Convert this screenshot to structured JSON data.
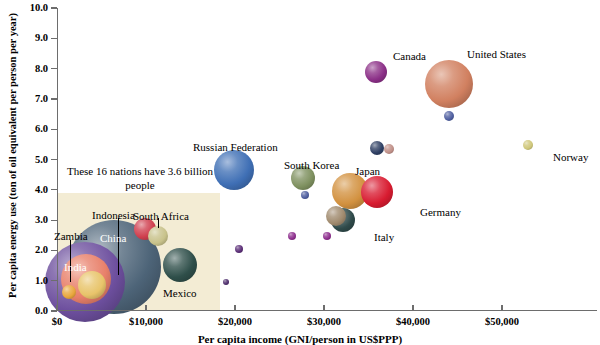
{
  "chart_data": {
    "type": "scatter",
    "title": "",
    "xlabel": "Per capita income (GNI/person in US$PPP)",
    "ylabel": "Per capita energy use (ton of oil equivalent per person per year)",
    "xlim": [
      0,
      55000
    ],
    "ylim": [
      0,
      10
    ],
    "grid": false,
    "legend": null,
    "bubble_meaning": "bubble area proportional to population",
    "annotation": "These 16 nations have 3.6 billion people",
    "xticks": [
      "$0",
      "$10,000",
      "$20,000",
      "$30,000",
      "$40,000",
      "$50,000"
    ],
    "xtick_values": [
      0,
      10000,
      20000,
      30000,
      40000,
      50000
    ],
    "yticks": [
      "0.0",
      "1.0",
      "2.0",
      "3.0",
      "4.0",
      "5.0",
      "6.0",
      "7.0",
      "8.0",
      "9.0",
      "10.0"
    ],
    "ytick_values": [
      0,
      1,
      2,
      3,
      4,
      5,
      6,
      7,
      8,
      9,
      10
    ],
    "points": [
      {
        "name": "Zambia",
        "x": 1300,
        "y": 0.62,
        "r": 7,
        "color": "#e8a63c",
        "label": "Zambia",
        "label_x": 54,
        "label_y": 231,
        "label_light": false,
        "leader": {
          "x": 70,
          "y": 240,
          "h": 42
        }
      },
      {
        "name": "India",
        "x": 3300,
        "y": 1.05,
        "r": 25,
        "color": "#e8806a",
        "label": "India",
        "label_x": 64,
        "label_y": 262,
        "label_light": true,
        "leader": null
      },
      {
        "name": "India-outer",
        "x": 3100,
        "y": 0.95,
        "r": 40,
        "color": "#6d4f9e",
        "label": "",
        "label_x": 0,
        "label_y": 0,
        "label_light": false,
        "leader": null
      },
      {
        "name": "Indonesia",
        "x": 3900,
        "y": 0.85,
        "r": 14,
        "color": "#e8c46a",
        "label": "Indonesia",
        "label_x": 92,
        "label_y": 210,
        "label_light": false,
        "leader": {
          "x": 118,
          "y": 218,
          "h": 57
        }
      },
      {
        "name": "China",
        "x": 6400,
        "y": 1.45,
        "r": 47,
        "color": "#4d6478",
        "label": "China",
        "label_x": 100,
        "label_y": 233,
        "label_light": true,
        "leader": null
      },
      {
        "name": "South Africa",
        "x": 9900,
        "y": 2.7,
        "r": 11,
        "color": "#cf3f4e",
        "label": "South Africa",
        "label_x": 133,
        "label_y": 211,
        "label_light": false,
        "leader": {
          "x": 158,
          "y": 218,
          "h": 10
        }
      },
      {
        "name": "Egypt",
        "x": 11300,
        "y": 2.48,
        "r": 10,
        "color": "#c8c28a",
        "label": "",
        "label_x": 0,
        "label_y": 0,
        "label_light": false,
        "leader": null
      },
      {
        "name": "Mexico",
        "x": 13800,
        "y": 1.52,
        "r": 17,
        "color": "#2f4f4a",
        "label": "Mexico",
        "label_x": 163,
        "label_y": 288,
        "label_light": false,
        "leader": null
      },
      {
        "name": "small-1",
        "x": 19000,
        "y": 0.95,
        "r": 3,
        "color": "#4f2f6e",
        "label": "",
        "label_x": 0,
        "label_y": 0,
        "label_light": false,
        "leader": null
      },
      {
        "name": "small-2",
        "x": 20500,
        "y": 2.05,
        "r": 4,
        "color": "#5c2f78",
        "label": "",
        "label_x": 0,
        "label_y": 0,
        "label_light": false,
        "leader": null
      },
      {
        "name": "Russian Federation",
        "x": 19900,
        "y": 4.65,
        "r": 20,
        "color": "#3f6fb5",
        "label": "Russian Federation",
        "label_x": 193,
        "label_y": 142,
        "label_light": false,
        "leader": null
      },
      {
        "name": "small-3",
        "x": 26400,
        "y": 2.48,
        "r": 4,
        "color": "#8e2f8e",
        "label": "",
        "label_x": 0,
        "label_y": 0,
        "label_light": false,
        "leader": null
      },
      {
        "name": "small-4",
        "x": 30300,
        "y": 2.48,
        "r": 4,
        "color": "#8e2f8e",
        "label": "",
        "label_x": 0,
        "label_y": 0,
        "label_light": false,
        "leader": null
      },
      {
        "name": "South Korea",
        "x": 27600,
        "y": 4.4,
        "r": 12,
        "color": "#7f9160",
        "label": "South Korea",
        "label_x": 284,
        "label_y": 160,
        "label_light": false,
        "leader": null
      },
      {
        "name": "small-5",
        "x": 27900,
        "y": 3.82,
        "r": 4,
        "color": "#4f5fa0",
        "label": "",
        "label_x": 0,
        "label_y": 0,
        "label_light": false,
        "leader": null
      },
      {
        "name": "Japan",
        "x": 32900,
        "y": 3.95,
        "r": 18,
        "color": "#d2913f",
        "label": "Japan",
        "label_x": 355,
        "label_y": 166,
        "label_light": false,
        "leader": null
      },
      {
        "name": "Italy",
        "x": 32100,
        "y": 3.0,
        "r": 12,
        "color": "#2f4a4a",
        "label": "Italy",
        "label_x": 374,
        "label_y": 232,
        "label_light": false,
        "leader": null
      },
      {
        "name": "Italy-b",
        "x": 31400,
        "y": 3.15,
        "r": 10,
        "color": "#a08a6e",
        "label": "",
        "label_x": 0,
        "label_y": 0,
        "label_light": false,
        "leader": null
      },
      {
        "name": "Germany",
        "x": 36000,
        "y": 3.93,
        "r": 16,
        "color": "#d81b30",
        "label": "Germany",
        "label_x": 420,
        "label_y": 207,
        "label_light": false,
        "leader": null
      },
      {
        "name": "small-6",
        "x": 36000,
        "y": 5.38,
        "r": 7,
        "color": "#2e3f63",
        "label": "",
        "label_x": 0,
        "label_y": 0,
        "label_light": false,
        "leader": null
      },
      {
        "name": "small-7",
        "x": 37300,
        "y": 5.35,
        "r": 5,
        "color": "#c09088",
        "label": "",
        "label_x": 0,
        "label_y": 0,
        "label_light": false,
        "leader": null
      },
      {
        "name": "Canada",
        "x": 35800,
        "y": 7.9,
        "r": 11,
        "color": "#8b2f87",
        "label": "Canada",
        "label_x": 393,
        "label_y": 51,
        "label_light": false,
        "leader": null
      },
      {
        "name": "United States",
        "x": 44000,
        "y": 7.48,
        "r": 24,
        "color": "#d18060",
        "label": "United States",
        "label_x": 467,
        "label_y": 49,
        "label_light": false,
        "leader": null
      },
      {
        "name": "small-8",
        "x": 44000,
        "y": 6.42,
        "r": 5,
        "color": "#4f5fa0",
        "label": "",
        "label_x": 0,
        "label_y": 0,
        "label_light": false,
        "leader": null
      },
      {
        "name": "Norway",
        "x": 52900,
        "y": 5.48,
        "r": 5,
        "color": "#cfc77a",
        "label": "Norway",
        "label_x": 553,
        "label_y": 152,
        "label_light": false,
        "leader": null
      }
    ]
  }
}
